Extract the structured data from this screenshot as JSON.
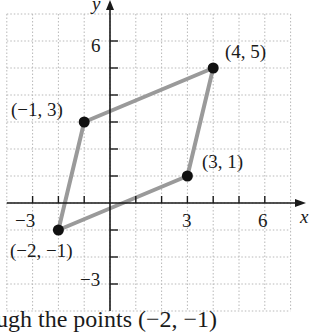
{
  "chart_data": {
    "type": "scatter",
    "title": "",
    "xlabel": "x",
    "ylabel": "y",
    "xlim": [
      -4,
      7
    ],
    "ylim": [
      -4,
      7
    ],
    "grid": true,
    "x_ticks": [
      -3,
      6
    ],
    "y_ticks": [
      6,
      -3
    ],
    "x_tick_labels": [
      "−3",
      "3",
      "6"
    ],
    "y_tick_labels": [
      "6",
      "−3"
    ],
    "points": [
      {
        "x": -2,
        "y": -1,
        "label": "(−2, −1)"
      },
      {
        "x": 3,
        "y": 1,
        "label": "(3, 1)"
      },
      {
        "x": 4,
        "y": 5,
        "label": "(4, 5)"
      },
      {
        "x": -1,
        "y": 3,
        "label": "(−1, 3)"
      }
    ],
    "polygon": {
      "shape": "parallelogram",
      "vertices": [
        [
          -2,
          -1
        ],
        [
          3,
          1
        ],
        [
          4,
          5
        ],
        [
          -1,
          3
        ]
      ],
      "stroke_color": "#9a9a9a"
    },
    "point_color": "#111111",
    "axis_color": "#1a1a1a",
    "grid_color": "#b8b8b8"
  },
  "caption": "ugh the points (−2, −1)"
}
